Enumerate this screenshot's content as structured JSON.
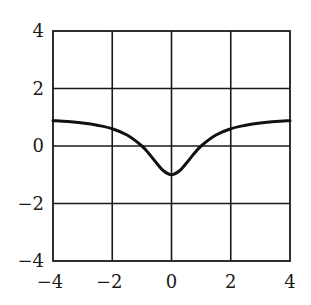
{
  "chart_data": {
    "type": "line",
    "title": "",
    "xlabel": "",
    "ylabel": "",
    "xlim": [
      -4,
      4
    ],
    "ylim": [
      -4,
      4
    ],
    "grid": true,
    "legend": null,
    "x_ticks": [
      -4,
      -2,
      0,
      2,
      4
    ],
    "y_ticks": [
      -4,
      -2,
      0,
      2,
      4
    ],
    "x_tick_labels": [
      "−4",
      "−2",
      "0",
      "2",
      "4"
    ],
    "y_tick_labels": [
      "−4",
      "−2",
      "0",
      "2",
      "4"
    ],
    "series": [
      {
        "name": "f(x)",
        "x": [
          -4,
          -3.5,
          -3,
          -2.5,
          -2,
          -1.5,
          -1,
          -0.75,
          -0.5,
          -0.25,
          0,
          0.25,
          0.5,
          0.75,
          1,
          1.5,
          2,
          2.5,
          3,
          3.5,
          4
        ],
        "values": [
          0.88,
          0.85,
          0.8,
          0.72,
          0.6,
          0.38,
          0.0,
          -0.28,
          -0.6,
          -0.88,
          -1.0,
          -0.88,
          -0.6,
          -0.28,
          0.0,
          0.38,
          0.6,
          0.72,
          0.8,
          0.85,
          0.88
        ]
      }
    ],
    "annotations": []
  },
  "colors": {
    "curve": "#111111",
    "grid": "#1a1a1a",
    "background": "#ffffff"
  }
}
